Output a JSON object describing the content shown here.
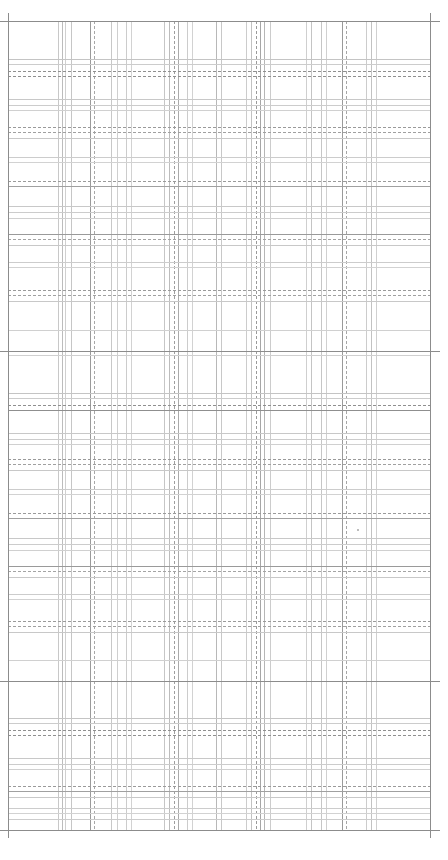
{
  "canvas": {
    "width": 448,
    "height": 860,
    "background": "#ffffff"
  },
  "frame": {
    "left": 8,
    "right": 430,
    "top": 21,
    "bottom": 830,
    "top_ext_left": 0,
    "top_ext_right": 440,
    "color": "#8c8c8c",
    "major_h": [
      351,
      681
    ]
  },
  "vertical_lines": [
    {
      "x": 58,
      "color": "#c8c8c8"
    },
    {
      "x": 62,
      "color": "#bcbcbc"
    },
    {
      "x": 65,
      "color": "#d0d0d0"
    },
    {
      "x": 71,
      "color": "#c6c6c6"
    },
    {
      "x": 90,
      "color": "#9a9a9a"
    },
    {
      "x": 94,
      "color": "#a8a8a8",
      "dashed": true
    },
    {
      "x": 111,
      "color": "#c8c8c8"
    },
    {
      "x": 117,
      "color": "#cfcfcf"
    },
    {
      "x": 126,
      "color": "#cccccc"
    },
    {
      "x": 131,
      "color": "#d2d2d2"
    },
    {
      "x": 164,
      "color": "#c6c6c6"
    },
    {
      "x": 169,
      "color": "#bcbcbc"
    },
    {
      "x": 174,
      "color": "#9e9e9e",
      "dashed": true
    },
    {
      "x": 178,
      "color": "#aaaaaa"
    },
    {
      "x": 187,
      "color": "#cccccc"
    },
    {
      "x": 192,
      "color": "#d2d2d2"
    },
    {
      "x": 216,
      "color": "#b8b8b8"
    },
    {
      "x": 221,
      "color": "#c8c8c8"
    },
    {
      "x": 246,
      "color": "#cccccc"
    },
    {
      "x": 251,
      "color": "#c2c2c2"
    },
    {
      "x": 256,
      "color": "#9a9a9a",
      "dashed": true
    },
    {
      "x": 260,
      "color": "#a6a6a6"
    },
    {
      "x": 264,
      "color": "#b6b6b6"
    },
    {
      "x": 270,
      "color": "#cccccc"
    },
    {
      "x": 306,
      "color": "#cfcfcf"
    },
    {
      "x": 311,
      "color": "#c4c4c4"
    },
    {
      "x": 321,
      "color": "#c6c6c6"
    },
    {
      "x": 326,
      "color": "#d0d0d0"
    },
    {
      "x": 342,
      "color": "#9a9a9a"
    },
    {
      "x": 346,
      "color": "#a6a6a6",
      "dashed": true
    },
    {
      "x": 366,
      "color": "#cccccc"
    },
    {
      "x": 371,
      "color": "#c2c2c2"
    },
    {
      "x": 376,
      "color": "#d0d0d0"
    }
  ],
  "horizontal_groups": [
    {
      "y": 59,
      "lines": [
        {
          "dy": 0,
          "color": "#c4c4c4"
        },
        {
          "dy": 5,
          "color": "#cccccc"
        },
        {
          "dy": 12,
          "color": "#8f8f8f",
          "dashed": true
        },
        {
          "dy": 17,
          "color": "#8f8f8f",
          "dashed": true
        }
      ]
    },
    {
      "y": 99,
      "lines": [
        {
          "dy": 0,
          "color": "#c8c8c8"
        },
        {
          "dy": 6,
          "color": "#cccccc"
        },
        {
          "dy": 11,
          "color": "#d0d0d0"
        }
      ]
    },
    {
      "y": 127,
      "lines": [
        {
          "dy": 0,
          "color": "#9a9a9a",
          "dashed": true
        },
        {
          "dy": 5,
          "color": "#a0a0a0",
          "dashed": true
        },
        {
          "dy": 11,
          "color": "#c8c8c8"
        }
      ]
    },
    {
      "y": 157,
      "lines": [
        {
          "dy": 0,
          "color": "#cccccc"
        },
        {
          "dy": 5,
          "color": "#d2d2d2"
        }
      ]
    },
    {
      "y": 181,
      "lines": [
        {
          "dy": 0,
          "color": "#9a9a9a",
          "dashed": true
        },
        {
          "dy": 5,
          "color": "#a0a0a0"
        }
      ]
    },
    {
      "y": 206,
      "lines": [
        {
          "dy": 0,
          "color": "#c8c8c8"
        },
        {
          "dy": 6,
          "color": "#cccccc"
        },
        {
          "dy": 12,
          "color": "#d0d0d0"
        }
      ]
    },
    {
      "y": 234,
      "lines": [
        {
          "dy": 0,
          "color": "#9a9a9a"
        },
        {
          "dy": 5,
          "color": "#a4a4a4",
          "dashed": true
        },
        {
          "dy": 11,
          "color": "#c8c8c8"
        }
      ]
    },
    {
      "y": 262,
      "lines": [
        {
          "dy": 0,
          "color": "#cccccc"
        },
        {
          "dy": 5,
          "color": "#d2d2d2"
        }
      ]
    },
    {
      "y": 290,
      "lines": [
        {
          "dy": 0,
          "color": "#9a9a9a",
          "dashed": true
        },
        {
          "dy": 5,
          "color": "#a0a0a0",
          "dashed": true
        },
        {
          "dy": 11,
          "color": "#c8c8c8"
        }
      ]
    },
    {
      "y": 330,
      "lines": [
        {
          "dy": 0,
          "color": "#d0d0d0"
        }
      ]
    },
    {
      "y": 355,
      "lines": [
        {
          "dy": 0,
          "color": "#d0d0d0"
        }
      ]
    },
    {
      "y": 393,
      "lines": [
        {
          "dy": 0,
          "color": "#c4c4c4"
        },
        {
          "dy": 5,
          "color": "#cccccc"
        },
        {
          "dy": 12,
          "color": "#8f8f8f",
          "dashed": true
        },
        {
          "dy": 17,
          "color": "#8f8f8f"
        }
      ]
    },
    {
      "y": 433,
      "lines": [
        {
          "dy": 0,
          "color": "#c8c8c8"
        },
        {
          "dy": 6,
          "color": "#cccccc"
        },
        {
          "dy": 11,
          "color": "#d0d0d0"
        }
      ]
    },
    {
      "y": 459,
      "lines": [
        {
          "dy": 0,
          "color": "#9a9a9a",
          "dashed": true
        },
        {
          "dy": 5,
          "color": "#a0a0a0",
          "dashed": true
        },
        {
          "dy": 11,
          "color": "#c8c8c8"
        }
      ]
    },
    {
      "y": 489,
      "lines": [
        {
          "dy": 0,
          "color": "#cccccc"
        },
        {
          "dy": 5,
          "color": "#d2d2d2"
        }
      ]
    },
    {
      "y": 513,
      "lines": [
        {
          "dy": 0,
          "color": "#9a9a9a",
          "dashed": true
        },
        {
          "dy": 5,
          "color": "#a0a0a0"
        }
      ]
    },
    {
      "y": 538,
      "lines": [
        {
          "dy": 0,
          "color": "#c8c8c8"
        },
        {
          "dy": 6,
          "color": "#cccccc"
        },
        {
          "dy": 12,
          "color": "#d0d0d0"
        }
      ]
    },
    {
      "y": 566,
      "lines": [
        {
          "dy": 0,
          "color": "#9a9a9a"
        },
        {
          "dy": 5,
          "color": "#a4a4a4",
          "dashed": true
        },
        {
          "dy": 11,
          "color": "#c8c8c8"
        }
      ]
    },
    {
      "y": 594,
      "lines": [
        {
          "dy": 0,
          "color": "#cccccc"
        },
        {
          "dy": 5,
          "color": "#d2d2d2"
        }
      ]
    },
    {
      "y": 621,
      "lines": [
        {
          "dy": 0,
          "color": "#9a9a9a",
          "dashed": true
        },
        {
          "dy": 5,
          "color": "#a0a0a0",
          "dashed": true
        },
        {
          "dy": 11,
          "color": "#c8c8c8"
        }
      ]
    },
    {
      "y": 660,
      "lines": [
        {
          "dy": 0,
          "color": "#d0d0d0"
        }
      ]
    },
    {
      "y": 718,
      "lines": [
        {
          "dy": 0,
          "color": "#c4c4c4"
        },
        {
          "dy": 5,
          "color": "#cccccc"
        },
        {
          "dy": 12,
          "color": "#8f8f8f",
          "dashed": true
        },
        {
          "dy": 17,
          "color": "#8f8f8f",
          "dashed": true
        }
      ]
    },
    {
      "y": 758,
      "lines": [
        {
          "dy": 0,
          "color": "#c8c8c8"
        },
        {
          "dy": 6,
          "color": "#cccccc"
        },
        {
          "dy": 11,
          "color": "#d0d0d0"
        }
      ]
    },
    {
      "y": 786,
      "lines": [
        {
          "dy": 0,
          "color": "#9a9a9a",
          "dashed": true
        },
        {
          "dy": 5,
          "color": "#a0a0a0"
        },
        {
          "dy": 11,
          "color": "#c8c8c8"
        }
      ]
    },
    {
      "y": 808,
      "lines": [
        {
          "dy": 0,
          "color": "#cccccc"
        },
        {
          "dy": 5,
          "color": "#d2d2d2"
        },
        {
          "dy": 11,
          "color": "#cccccc"
        }
      ]
    }
  ],
  "specks": [
    {
      "x": 357,
      "y": 529
    }
  ]
}
